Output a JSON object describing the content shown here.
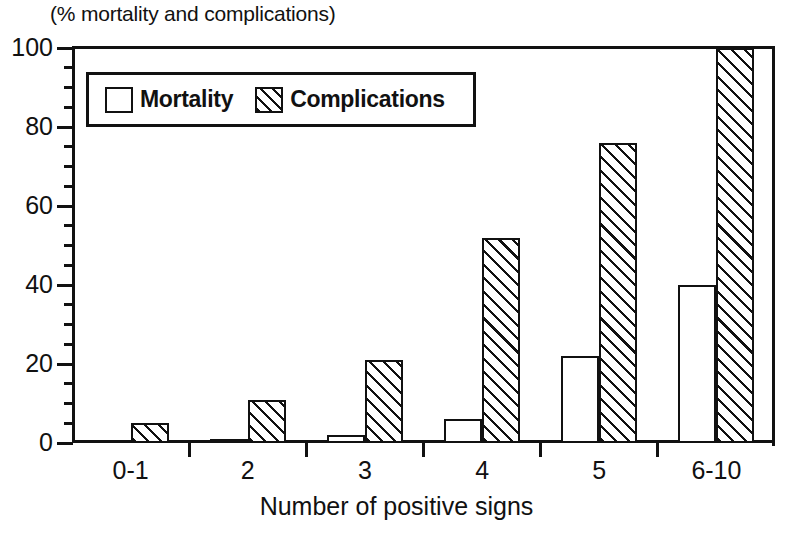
{
  "chart_data": {
    "type": "bar",
    "title": "(% mortality and complications)",
    "xlabel": "Number of positive signs",
    "ylabel": "",
    "categories": [
      "0-1",
      "2",
      "3",
      "4",
      "5",
      "6-10"
    ],
    "series": [
      {
        "name": "Mortality",
        "values": [
          0,
          1,
          2,
          6,
          22,
          40
        ],
        "fill": "white",
        "pattern": "solid"
      },
      {
        "name": "Complications",
        "values": [
          5,
          11,
          21,
          52,
          76,
          100
        ],
        "fill": "white",
        "pattern": "diagonal-hatch"
      }
    ],
    "ylim": [
      0,
      100
    ],
    "y_major_ticks": [
      0,
      20,
      40,
      60,
      80,
      100
    ],
    "y_minor_tick_step": 5,
    "y_tick_labels": [
      "0",
      "20",
      "40",
      "60",
      "80",
      "100"
    ],
    "grid": false,
    "legend_position": "top-left-inside",
    "legend_entries": [
      "Mortality",
      "Complications"
    ],
    "colors": {
      "ink": "#111111",
      "background": "#ffffff"
    }
  }
}
